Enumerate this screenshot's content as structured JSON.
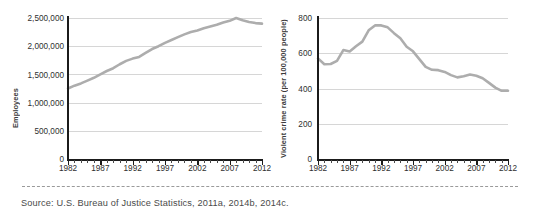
{
  "figure": {
    "source_note": "Source: U.S. Bureau of Justice Statistics, 2011a, 2014b, 2014c.",
    "line_color": "#adadad",
    "grid_color": "#d6d6d6",
    "axis_color": "#1b1b1b",
    "background": "#ffffff"
  },
  "chart_data": [
    {
      "type": "line",
      "id": "employees-chart",
      "title": "",
      "xlabel": "",
      "ylabel": "Employees",
      "xlim": [
        1982,
        2012
      ],
      "ylim": [
        0,
        2500000
      ],
      "yticks": [
        0,
        500000,
        1000000,
        1500000,
        2000000,
        2500000
      ],
      "ytick_labels": [
        "0",
        "500,000",
        "1,000,000",
        "1,500,000",
        "2,000,000",
        "2,500,000"
      ],
      "xticks": [
        1982,
        1987,
        1992,
        1997,
        2002,
        2007,
        2012
      ],
      "xtick_labels": [
        "1982",
        "1987",
        "1992",
        "1997",
        "2002",
        "2007",
        "2012"
      ],
      "xminor_step": 1,
      "grid": true,
      "grid_axis": "y",
      "legend": "none",
      "x": [
        1982,
        1983,
        1984,
        1985,
        1986,
        1987,
        1988,
        1989,
        1990,
        1991,
        1992,
        1993,
        1994,
        1995,
        1996,
        1997,
        1998,
        1999,
        2000,
        2001,
        2002,
        2003,
        2004,
        2005,
        2006,
        2007,
        2008,
        2009,
        2010,
        2011,
        2012
      ],
      "values": [
        1250000,
        1300000,
        1340000,
        1390000,
        1440000,
        1500000,
        1560000,
        1610000,
        1680000,
        1740000,
        1780000,
        1810000,
        1880000,
        1950000,
        2000000,
        2060000,
        2110000,
        2160000,
        2210000,
        2250000,
        2280000,
        2320000,
        2350000,
        2380000,
        2420000,
        2450000,
        2500000,
        2460000,
        2430000,
        2410000,
        2400000
      ]
    },
    {
      "type": "line",
      "id": "violent-crime-rate-chart",
      "title": "",
      "xlabel": "",
      "ylabel": "Violent crime rate (per 100,000 people)",
      "xlim": [
        1982,
        2012
      ],
      "ylim": [
        0,
        800
      ],
      "yticks": [
        0,
        200,
        400,
        600,
        800
      ],
      "ytick_labels": [
        "0",
        "200",
        "400",
        "600",
        "800"
      ],
      "xticks": [
        1982,
        1987,
        1992,
        1997,
        2002,
        2007,
        2012
      ],
      "xtick_labels": [
        "1982",
        "1987",
        "1992",
        "1997",
        "2002",
        "2007",
        "2012"
      ],
      "xminor_step": 1,
      "grid": true,
      "grid_axis": "y",
      "legend": "none",
      "x": [
        1982,
        1983,
        1984,
        1985,
        1986,
        1987,
        1988,
        1989,
        1990,
        1991,
        1992,
        1993,
        1994,
        1995,
        1996,
        1997,
        1998,
        1999,
        2000,
        2001,
        2002,
        2003,
        2004,
        2005,
        2006,
        2007,
        2008,
        2009,
        2010,
        2011,
        2012
      ],
      "values": [
        571,
        538,
        539,
        557,
        618,
        610,
        640,
        666,
        730,
        758,
        758,
        747,
        714,
        685,
        637,
        611,
        567,
        523,
        506,
        504,
        494,
        476,
        463,
        469,
        479,
        472,
        458,
        432,
        405,
        387,
        387
      ]
    }
  ]
}
